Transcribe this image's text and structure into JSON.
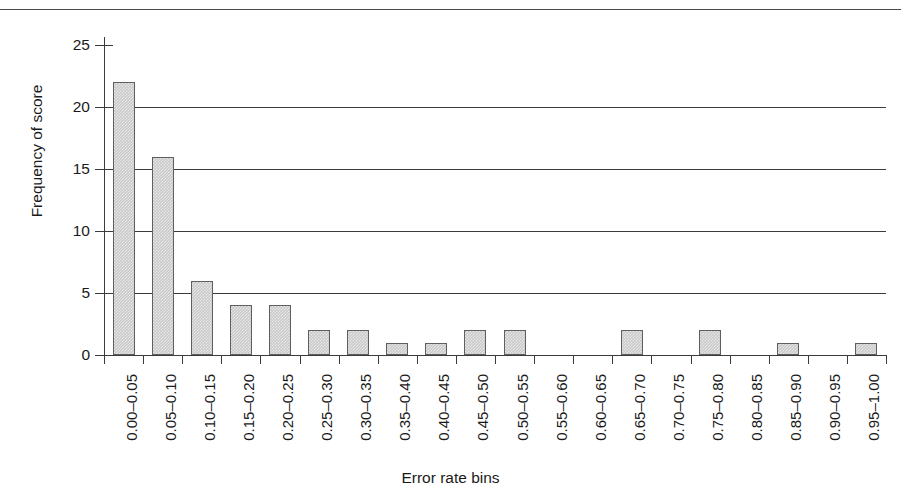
{
  "page": {
    "running_head_remnant": "",
    "background": "#ffffff"
  },
  "chart_data": {
    "type": "bar",
    "title": "",
    "xlabel": "Error rate bins",
    "ylabel": "Frequency of score",
    "categories": [
      "0.00–0.05",
      "0.05–0.10",
      "0.10–0.15",
      "0.15–0.20",
      "0.20–0.25",
      "0.25–0.30",
      "0.30–0.35",
      "0.35–0.40",
      "0.40–0.45",
      "0.45–0.50",
      "0.50–0.55",
      "0.55–0.60",
      "0.60–0.65",
      "0.65–0.70",
      "0.70–0.75",
      "0.75–0.80",
      "0.80–0.85",
      "0.85–0.90",
      "0.90–0.95",
      "0.95–1.00"
    ],
    "values": [
      22,
      16,
      6,
      4,
      4,
      2,
      2,
      1,
      1,
      2,
      2,
      0,
      0,
      2,
      0,
      2,
      0,
      1,
      0,
      1
    ],
    "ylim": [
      0,
      25
    ],
    "yticks": [
      0,
      5,
      10,
      15,
      20,
      25
    ],
    "ytick_labels": [
      "0",
      "5",
      "10",
      "15",
      "20",
      "25"
    ],
    "gridlines_at": [
      5,
      10,
      15,
      20
    ],
    "grid": true,
    "legend": "none",
    "bar_fill": "#c9c9c9",
    "bar_border": "#5f5f5f",
    "axis_color": "#3b3b3b"
  }
}
